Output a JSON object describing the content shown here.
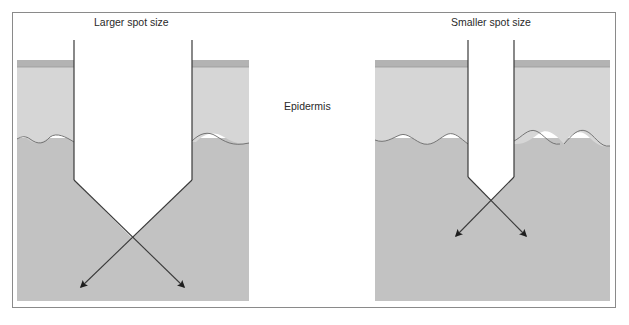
{
  "labels": {
    "left_title": "Larger spot size",
    "right_title": "Smaller spot size",
    "center_layer": "Epidermis"
  },
  "colors": {
    "stratum": "#b3b3b3",
    "epidermis": "#d6d6d6",
    "dermis": "#c2c2c2",
    "lines": "#3a3a3a",
    "arrowhead": "#1e1e1e",
    "frame": "#8a8a8a"
  },
  "panels": [
    {
      "name": "larger-spot",
      "probe_width_px": 118
    },
    {
      "name": "smaller-spot",
      "probe_width_px": 46
    }
  ]
}
